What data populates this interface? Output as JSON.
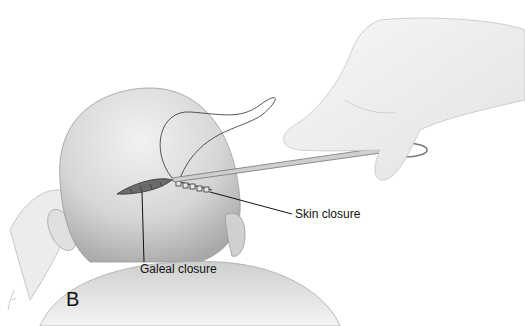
{
  "figure": {
    "panel_letter": "B",
    "labels": {
      "skin_closure": "Skin closure",
      "galeal_closure": "Galeal closure"
    },
    "colors": {
      "background": "#ffffff",
      "skin": "#d9d9d9",
      "line": "#111111"
    }
  }
}
